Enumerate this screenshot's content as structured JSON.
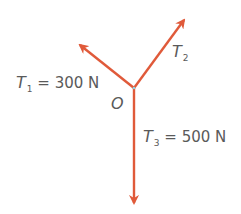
{
  "diagram": {
    "title": "",
    "origin": {
      "label": "O",
      "x": 134,
      "y": 88
    },
    "arrow_color": "#e05a3a",
    "forces": [
      {
        "symbol": "T",
        "subscript": "1",
        "value": "300 N",
        "eq": "=",
        "tip": {
          "x": 78,
          "y": 43
        },
        "direction": "up-left"
      },
      {
        "symbol": "T",
        "subscript": "2",
        "value": "",
        "eq": "",
        "tip": {
          "x": 186,
          "y": 18
        },
        "direction": "up-right"
      },
      {
        "symbol": "T",
        "subscript": "3",
        "value": "500 N",
        "eq": "=",
        "tip": {
          "x": 134,
          "y": 205
        },
        "direction": "down"
      }
    ]
  }
}
